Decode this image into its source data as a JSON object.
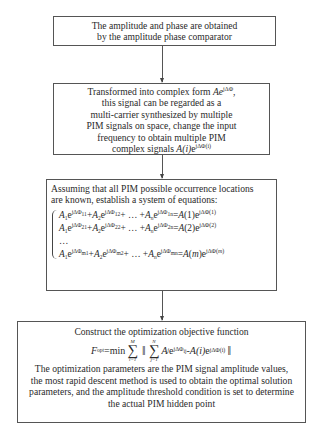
{
  "diagram": {
    "type": "flowchart",
    "boxes": [
      {
        "id": "step1",
        "lines": [
          "The amplitude and phase are obtained",
          "by the amplitude phase comparator"
        ]
      },
      {
        "id": "step2",
        "lines": [
          "Transformed into complex form Ae^{jΔΦ},",
          "this signal can be regarded as a",
          "multi-carrier synthesized by multiple",
          "PIM signals on space, change the input",
          "frequency to obtain multiple PIM",
          "complex signals A(i)e^{jΔΦ(i)}"
        ],
        "line1_text": "Transformed into complex form ",
        "line1_math": "Ae",
        "line1_sup": "jΔΦ",
        "line1_tail": ",",
        "line2": "this signal can be regarded as a",
        "line3": "multi-carrier synthesized by multiple",
        "line4": "PIM signals on space, change the input",
        "line5": "frequency to obtain multiple PIM",
        "line6_text": "complex signals ",
        "line6_math": "A(i)",
        "line6_e": "e",
        "line6_sup": "jΔΦ(i)"
      },
      {
        "id": "step3",
        "intro": [
          "Assuming that all PIM possible occurrence locations",
          "are known, establish a system of equations:"
        ],
        "equations": [
          {
            "lhs": "A1e^{jΔΦ11}+A2e^{jΔΦ12}+ … +Ane^{jΔΦ1n}",
            "rhs": "A(1)e^{jΔΦ(1)}",
            "row": "1",
            "idx": "(1)"
          },
          {
            "lhs": "A1e^{jΔΦ21}+A2e^{jΔΦ22}+ … +Ane^{jΔΦ2n}",
            "rhs": "A(2)e^{jΔΦ(2)}",
            "row": "2",
            "idx": "(2)"
          },
          {
            "ellipsis": "…"
          },
          {
            "lhs": "A1e^{jΔΦm1}+A2e^{jΔΦm2}+ … +Ane^{jΔΦmn}",
            "rhs": "A(m)e^{jΔΦ(m)}",
            "row": "m",
            "idx": "(m)"
          }
        ],
        "ellipsis": "…"
      },
      {
        "id": "step4",
        "title": "Construct the optimization objective function",
        "formula": {
          "lhs": "F",
          "lhs_sub": "opt",
          "op": "=min",
          "outer_sum": {
            "upper": "M",
            "lower": "i=1"
          },
          "inner_sum": {
            "upper": "N",
            "lower": "j=1"
          },
          "term": "A",
          "term_sub": "j",
          "term_sup": "jΔΦ",
          "term_sup_sub": "ij",
          "minus": " - ",
          "rhs": "A(i)",
          "rhs_sup": "jΔΦ(i)"
        },
        "lines": [
          "The optimization parameters are the PIM signal amplitude values,",
          "the most rapid descent method is used to obtain the optimal solution",
          "parameters, and the amplitude threshold condition is set to determine",
          "the actual PIM hidden point"
        ]
      }
    ],
    "edges": [
      {
        "from": "step1",
        "to": "step2"
      },
      {
        "from": "step2",
        "to": "step3"
      },
      {
        "from": "step3",
        "to": "step4"
      }
    ],
    "colors": {
      "border": "#555555",
      "text": "#2a2a2a",
      "background": "#ffffff"
    }
  }
}
